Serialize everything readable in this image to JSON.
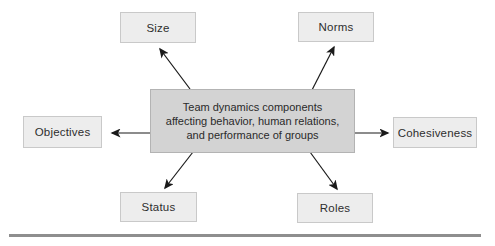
{
  "figure": {
    "center_box": {
      "lines": [
        "Team dynamics components",
        "affecting behavior, human relations,",
        "and performance of groups"
      ]
    },
    "nodes": {
      "size": "Size",
      "norms": "Norms",
      "objectives": "Objectives",
      "cohesiveness": "Cohesiveness",
      "status": "Status",
      "roles": "Roles"
    },
    "colors": {
      "center_fill": "#d3d3d3",
      "center_border": "#b3b3b3",
      "node_fill": "#ededed",
      "node_border": "#c9c9c9",
      "arrow": "#1a1a1a",
      "text": "#2a2a2a",
      "bottom_rule": "#8e8e8e"
    }
  }
}
